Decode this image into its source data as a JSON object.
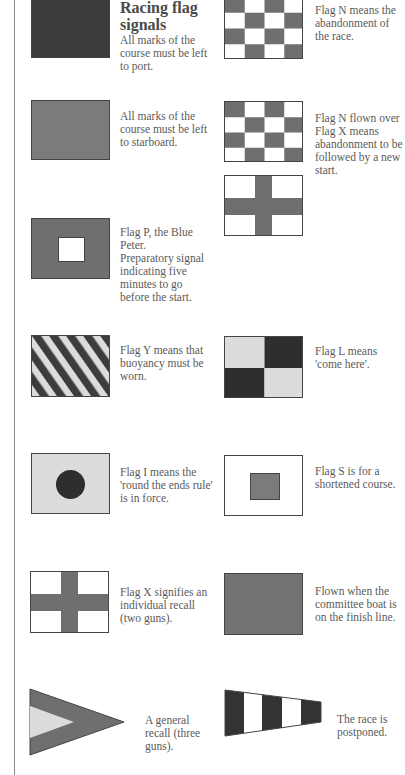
{
  "page": {
    "title": "Racing flag signals"
  },
  "colors": {
    "dark": "#3c3c3c",
    "medium": "#7b7b7b",
    "light": "#dddddd",
    "white": "#ffffff"
  },
  "left_column": [
    {
      "id": "dark-flag",
      "description": "All marks of the course must be left to port."
    },
    {
      "id": "medium-flag",
      "description": "All marks of the course must be left to starboard."
    },
    {
      "id": "flag-p",
      "description_lines": [
        "Flag P, the Blue Peter.",
        "Preparatory signal indicating five minutes to go before the start."
      ]
    },
    {
      "id": "flag-y",
      "description": "Flag Y means that buoyancy must be worn."
    },
    {
      "id": "flag-i",
      "description": "Flag I means the 'round the ends rule' is in force."
    },
    {
      "id": "flag-x",
      "description": "Flag X signifies an individual recall (two guns)."
    },
    {
      "id": "first-substitute-pennant",
      "description": "A general recall (three guns)."
    }
  ],
  "right_column": [
    {
      "id": "flag-n",
      "description": "Flag N means the abandonment of the race."
    },
    {
      "id": "flag-n-over-x",
      "description": "Flag N flown over Flag X means abandonment to be followed by a new start."
    },
    {
      "id": "flag-l",
      "description": "Flag L means 'come here'."
    },
    {
      "id": "flag-s",
      "description": "Flag S is for a shortened course."
    },
    {
      "id": "blue-flag",
      "description": "Flown when the committee boat is on the finish line."
    },
    {
      "id": "answering-pennant",
      "description": "The race is postponed."
    }
  ]
}
